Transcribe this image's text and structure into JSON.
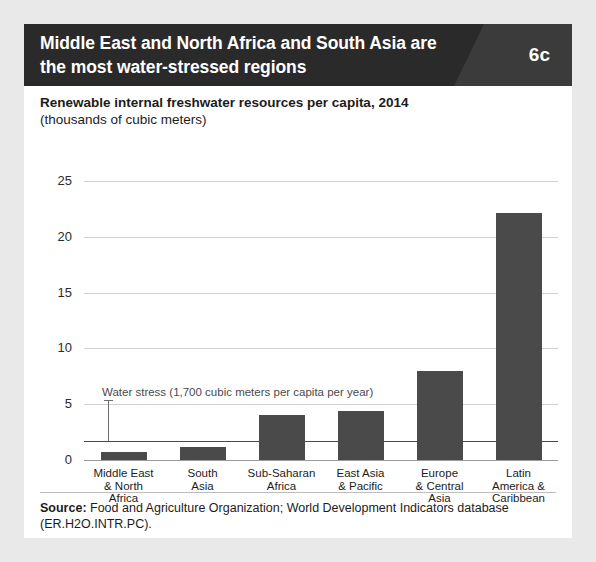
{
  "figure": {
    "title": "Middle East and North Africa and South Asia are the most water-stressed regions",
    "badge": "6c",
    "subtitle_line1": "Renewable internal freshwater resources per capita, 2014",
    "subtitle_line2": "(thousands of cubic meters)",
    "source_label": "Source:",
    "source_text": " Food and Agriculture Organization; World Development Indicators database (ER.H2O.INTR.PC).",
    "colors": {
      "title_bar_dark": "#2a2a2a",
      "title_bar_light": "#3b3b3b",
      "bar_fill": "#4a4a4a",
      "gridline": "#cfcfcf",
      "page_background": "#e9e9e9",
      "card_background": "#ffffff"
    }
  },
  "chart_data": {
    "type": "bar",
    "title": "Renewable internal freshwater resources per capita, 2014",
    "subtitle": "(thousands of cubic meters)",
    "xlabel": "",
    "ylabel": "thousands of cubic meters",
    "ylim": [
      0,
      25
    ],
    "yticks": [
      0,
      5,
      10,
      15,
      20,
      25
    ],
    "ytick_labels": [
      "0",
      "5",
      "10",
      "15",
      "20",
      "25"
    ],
    "grid": true,
    "legend": false,
    "categories": [
      "Middle East & North Africa",
      "South Asia",
      "Sub-Saharan Africa",
      "East Asia & Pacific",
      "Europe & Central Asia",
      "Latin America & Caribbean"
    ],
    "category_label_lines": [
      [
        "Middle East",
        "& North",
        "Africa"
      ],
      [
        "South",
        "Asia"
      ],
      [
        "Sub-Saharan",
        "Africa"
      ],
      [
        "East Asia",
        "& Pacific"
      ],
      [
        "Europe",
        "& Central",
        "Asia"
      ],
      [
        "Latin",
        "America &",
        "Caribbean"
      ]
    ],
    "values": [
      0.7,
      1.2,
      4.0,
      4.4,
      8.0,
      22.1
    ],
    "annotations": [
      {
        "text": "Water stress (1,700 cubic meters per capita per year)",
        "value": 1.7,
        "kind": "reference-line"
      }
    ]
  }
}
